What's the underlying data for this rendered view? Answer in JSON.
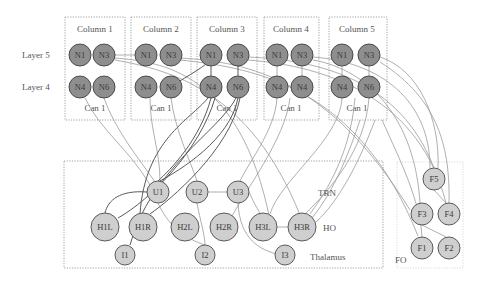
{
  "diagram": {
    "row_labels": [
      "Layer 5",
      "Layer 4"
    ],
    "columns": [
      {
        "title": "Column 1",
        "footer": "Can 1",
        "layer5": [
          "N1",
          "N3"
        ],
        "layer4": [
          "N4",
          "N6"
        ]
      },
      {
        "title": "Column 2",
        "footer": "Can 1",
        "layer5": [
          "N1",
          "N3"
        ],
        "layer4": [
          "N4",
          "N6"
        ]
      },
      {
        "title": "Column 3",
        "footer": "Can 1",
        "layer5": [
          "N1",
          "N3"
        ],
        "layer4": [
          "N4",
          "N6"
        ]
      },
      {
        "title": "Column 4",
        "footer": "Can 1",
        "layer5": [
          "N1",
          "N3"
        ],
        "layer4": [
          "N4",
          "N4"
        ]
      },
      {
        "title": "Column 5",
        "footer": "Can 1",
        "layer5": [
          "N1",
          "N3"
        ],
        "layer4": [
          "N4",
          "N6"
        ]
      }
    ],
    "thalamus": {
      "label": "Thalamus",
      "trn_label": "TRN",
      "ho_label": "HO",
      "nodes": {
        "U1": "U1",
        "U2": "U2",
        "U3": "U3",
        "H1L": "H1L",
        "H1R": "H1R",
        "H2L": "H2L",
        "H2R": "H2R",
        "H3L": "H3L",
        "H3R": "H3R",
        "I1": "I1",
        "I2": "I2",
        "I3": "I3"
      }
    },
    "fo": {
      "label": "FO",
      "nodes": {
        "F1": "F1",
        "F2": "F2",
        "F3": "F3",
        "F4": "F4",
        "F5": "F5"
      }
    }
  }
}
